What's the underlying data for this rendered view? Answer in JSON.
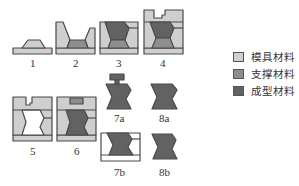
{
  "colors": {
    "mold": "#cfcfcf",
    "support": "#8e8e8e",
    "build": "#626262",
    "outline": "#4a4a4a"
  },
  "figures": [
    {
      "id": "1",
      "label": "1"
    },
    {
      "id": "2",
      "label": "2"
    },
    {
      "id": "3",
      "label": "3"
    },
    {
      "id": "4",
      "label": "4"
    },
    {
      "id": "5",
      "label": "5"
    },
    {
      "id": "6",
      "label": "6"
    },
    {
      "id": "7a",
      "label": "7a"
    },
    {
      "id": "8a",
      "label": "8a"
    },
    {
      "id": "7b",
      "label": "7b"
    },
    {
      "id": "8b",
      "label": "8b"
    }
  ],
  "legend": {
    "items": [
      {
        "label": "模具材料",
        "color": "#cfcfcf"
      },
      {
        "label": "支撑材料",
        "color": "#8e8e8e"
      },
      {
        "label": "成型材料",
        "color": "#626262"
      }
    ]
  }
}
